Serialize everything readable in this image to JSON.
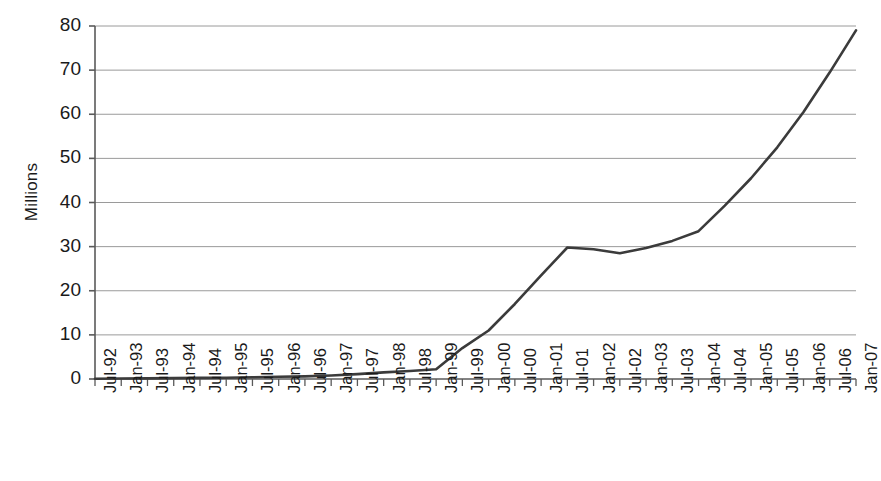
{
  "chart_data": {
    "type": "line",
    "title": "",
    "subtitle": "",
    "xlabel": "",
    "ylabel": "Millions",
    "ylim": [
      0,
      80
    ],
    "yticks": [
      0,
      10,
      20,
      30,
      40,
      50,
      60,
      70,
      80
    ],
    "ytick_labels": [
      "0",
      "10",
      "20",
      "30",
      "40",
      "50",
      "60",
      "70",
      "80"
    ],
    "grid": "horizontal",
    "legend": "none",
    "line_color": "#3b3b3b",
    "gridline_color": "#9a9a9a",
    "axis_color": "#5a5a5a",
    "background_color": "#ffffff",
    "x": [
      "Jul-92",
      "Jan-93",
      "Jul-93",
      "Jan-94",
      "Jul-94",
      "Jan-95",
      "Jul-95",
      "Jan-96",
      "Jul-96",
      "Jan-97",
      "Jul-97",
      "Jan-98",
      "Jul-98",
      "Jan-99",
      "Jul-99",
      "Jan-00",
      "Jul-00",
      "Jan-01",
      "Jul-01",
      "Jan-02",
      "Jul-02",
      "Jan-03",
      "Jul-03",
      "Jan-04",
      "Jul-04",
      "Jan-05",
      "Jul-05",
      "Jan-06",
      "Jul-06",
      "Jan-07"
    ],
    "categories": [
      "Jul-92",
      "Jan-93",
      "Jul-93",
      "Jan-94",
      "Jul-94",
      "Jan-95",
      "Jul-95",
      "Jan-96",
      "Jul-96",
      "Jan-97",
      "Jul-97",
      "Jan-98",
      "Jul-98",
      "Jan-99",
      "Jul-99",
      "Jan-00",
      "Jul-00",
      "Jan-01",
      "Jul-01",
      "Jan-02",
      "Jul-02",
      "Jan-03",
      "Jul-03",
      "Jan-04",
      "Jul-04",
      "Jan-05",
      "Jul-05",
      "Jan-06",
      "Jul-06",
      "Jan-07"
    ],
    "values": [
      0.05,
      0.1,
      0.15,
      0.2,
      0.25,
      0.3,
      0.4,
      0.5,
      0.6,
      0.8,
      1.1,
      1.5,
      1.8,
      2.2,
      7.0,
      11.0,
      17.0,
      23.5,
      29.8,
      29.4,
      28.5,
      29.7,
      31.3,
      33.5,
      39.3,
      45.5,
      52.5,
      60.5,
      69.5,
      79.0
    ],
    "series": [
      {
        "name": "Millions",
        "values": [
          0.05,
          0.1,
          0.15,
          0.2,
          0.25,
          0.3,
          0.4,
          0.5,
          0.6,
          0.8,
          1.1,
          1.5,
          1.8,
          2.2,
          7.0,
          11.0,
          17.0,
          23.5,
          29.8,
          29.4,
          28.5,
          29.7,
          31.3,
          33.5,
          39.3,
          45.5,
          52.5,
          60.5,
          69.5,
          79.0
        ]
      }
    ],
    "annotations": []
  }
}
